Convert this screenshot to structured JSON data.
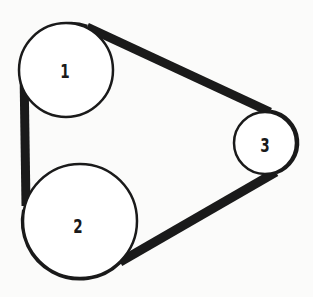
{
  "diagram": {
    "type": "belt-and-pulley",
    "pulleys": [
      {
        "id": "1",
        "label": "1",
        "cx": 66,
        "cy": 70,
        "r": 47
      },
      {
        "id": "2",
        "label": "2",
        "cx": 80,
        "cy": 221,
        "r": 57
      },
      {
        "id": "3",
        "label": "3",
        "cx": 265,
        "cy": 143,
        "r": 31
      }
    ],
    "belt": {
      "color": "#1a1a1a",
      "width": 9
    },
    "colors": {
      "background": "#fbfbfa",
      "stroke": "#1a1a1a",
      "fill": "#ffffff"
    }
  }
}
